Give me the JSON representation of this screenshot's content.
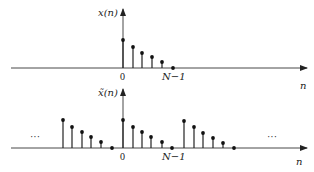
{
  "diagram": {
    "top_plot": {
      "ylabel": "x(n)",
      "xlabel": "n",
      "tick_zero": "0",
      "tick_end": "N−1",
      "origin_x": 123,
      "baseline_y": 68,
      "stems": [
        {
          "x": 123,
          "top": 40
        },
        {
          "x": 133,
          "top": 47
        },
        {
          "x": 142,
          "top": 53
        },
        {
          "x": 152,
          "top": 57
        },
        {
          "x": 162,
          "top": 62
        },
        {
          "x": 173,
          "top": 68
        }
      ]
    },
    "bottom_plot": {
      "ylabel": "x̃(n)",
      "xlabel": "n",
      "tick_zero": "0",
      "tick_end": "N−1",
      "ellipsis_left": "···",
      "ellipsis_right": "···",
      "origin_x": 123,
      "baseline_y": 148,
      "stems": [
        {
          "x": 63,
          "top": 120
        },
        {
          "x": 72,
          "top": 127
        },
        {
          "x": 82,
          "top": 132
        },
        {
          "x": 91,
          "top": 137
        },
        {
          "x": 101,
          "top": 142
        },
        {
          "x": 112,
          "top": 148
        },
        {
          "x": 123,
          "top": 120
        },
        {
          "x": 133,
          "top": 127
        },
        {
          "x": 142,
          "top": 132
        },
        {
          "x": 151,
          "top": 137
        },
        {
          "x": 162,
          "top": 142
        },
        {
          "x": 172,
          "top": 148
        },
        {
          "x": 184,
          "top": 121
        },
        {
          "x": 194,
          "top": 127
        },
        {
          "x": 203,
          "top": 133
        },
        {
          "x": 213,
          "top": 138
        },
        {
          "x": 223,
          "top": 143
        },
        {
          "x": 234,
          "top": 148
        }
      ]
    }
  }
}
